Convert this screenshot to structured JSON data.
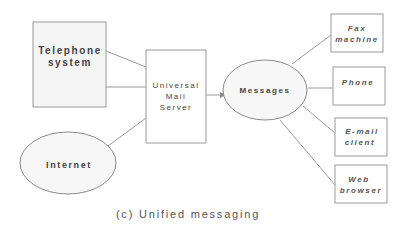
{
  "diagram": {
    "caption": "(c) Unified messaging",
    "nodes": {
      "telephone": {
        "lines": [
          "Telephone",
          "system"
        ],
        "shape": "rectangle"
      },
      "internet": {
        "lines": [
          "Internet"
        ],
        "shape": "ellipse"
      },
      "server": {
        "lines": [
          "Universal",
          "Mail",
          "Server"
        ],
        "shape": "rectangle"
      },
      "messages": {
        "lines": [
          "Messages"
        ],
        "shape": "ellipse"
      },
      "fax": {
        "lines": [
          "Fax",
          "machine"
        ],
        "shape": "rectangle"
      },
      "phone": {
        "lines": [
          "Phone"
        ],
        "shape": "rectangle"
      },
      "email": {
        "lines": [
          "E-mail",
          "client"
        ],
        "shape": "rectangle"
      },
      "web": {
        "lines": [
          "Web",
          "browser"
        ],
        "shape": "rectangle"
      }
    },
    "edges": [
      {
        "from": "telephone",
        "to": "server"
      },
      {
        "from": "telephone",
        "to": "server"
      },
      {
        "from": "internet",
        "to": "server"
      },
      {
        "from": "server",
        "to": "messages",
        "arrow": true
      },
      {
        "from": "messages",
        "to": "fax"
      },
      {
        "from": "messages",
        "to": "phone"
      },
      {
        "from": "messages",
        "to": "email"
      },
      {
        "from": "messages",
        "to": "web"
      }
    ]
  }
}
